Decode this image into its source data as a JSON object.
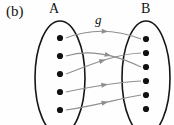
{
  "figure": {
    "panel_label": "(b)",
    "function_label": "g",
    "set_a_label": "A",
    "set_b_label": "B",
    "type": "function-mapping-diagram",
    "colors": {
      "ellipse_stroke": "#151515",
      "dot_fill": "#111111",
      "arrow_stroke": "#8e8e8e",
      "text": "#131313",
      "background": "#fefefe"
    },
    "sets": {
      "A": {
        "label": "A",
        "element_count": 5,
        "ellipse": {
          "cx": 60,
          "cy": 78,
          "rx": 25,
          "ry": 57
        },
        "elements": [
          {
            "id": "a1",
            "cx": 60,
            "cy": 38
          },
          {
            "id": "a2",
            "cx": 60,
            "cy": 56
          },
          {
            "id": "a3",
            "cx": 60,
            "cy": 74
          },
          {
            "id": "a4",
            "cx": 60,
            "cy": 92
          },
          {
            "id": "a5",
            "cx": 60,
            "cy": 110
          }
        ]
      },
      "B": {
        "label": "B",
        "element_count": 6,
        "ellipse": {
          "cx": 146,
          "cy": 78,
          "rx": 24,
          "ry": 57
        },
        "elements": [
          {
            "id": "b1",
            "cx": 146,
            "cy": 39
          },
          {
            "id": "b2",
            "cx": 146,
            "cy": 53
          },
          {
            "id": "b3",
            "cx": 146,
            "cy": 67
          },
          {
            "id": "b4",
            "cx": 146,
            "cy": 81
          },
          {
            "id": "b5",
            "cx": 146,
            "cy": 95
          },
          {
            "id": "b6",
            "cx": 146,
            "cy": 109
          }
        ]
      }
    },
    "arrows": [
      {
        "id": "g-a1-b1",
        "from": "a1",
        "to": "b1",
        "path": "M 66 38 C 92 28 118 30 141 39",
        "arrowhead_at": 0.52
      },
      {
        "id": "g-a2-b3",
        "from": "a2",
        "to": "b3",
        "path": "M 66 56 C 92 48 118 56 141 67",
        "arrowhead_at": 0.55
      },
      {
        "id": "g-a3-b2",
        "from": "a3",
        "to": "b2",
        "path": "M 66 74 C 92 64 116 54 141 53",
        "arrowhead_at": 0.5
      },
      {
        "id": "g-a4-b4",
        "from": "a4",
        "to": "b4",
        "path": "M 66 92 C 94 86 118 82 141 81",
        "arrowhead_at": 0.52
      },
      {
        "id": "g-a5-b5",
        "from": "a5",
        "to": "b5",
        "path": "M 66 110 C 94 106 118 99 141 95",
        "arrowhead_at": 0.52
      }
    ]
  }
}
